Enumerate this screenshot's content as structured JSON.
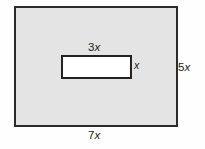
{
  "figure": {
    "type": "geometry-diagram",
    "canvas": {
      "width": 205,
      "height": 149,
      "background": "#fefefe"
    },
    "outer_rectangle": {
      "fill": "#e4e4e4",
      "stroke": "#2b2b2b",
      "width_label": "7x",
      "height_label": "5x"
    },
    "inner_rectangle": {
      "fill": "#ffffff",
      "stroke": "#222222",
      "width_label": "3x",
      "height_label": "x"
    }
  },
  "labels": {
    "inner_width": {
      "coefficient": "3",
      "variable": "x"
    },
    "inner_height": {
      "coefficient": "",
      "variable": "x"
    },
    "outer_height": {
      "coefficient": "5",
      "variable": "x"
    },
    "outer_width": {
      "coefficient": "7",
      "variable": "x"
    }
  }
}
